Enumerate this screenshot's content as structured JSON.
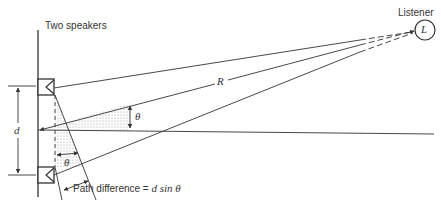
{
  "diagram": {
    "labels": {
      "two_speakers": "Two speakers",
      "listener": "Listener",
      "listener_symbol": "L",
      "distance": "R",
      "separation": "d",
      "angle_right": "θ",
      "angle_bottom": "θ",
      "path_difference": "Path difference = ",
      "path_difference_formula": "d sin θ"
    },
    "colors": {
      "line": "#333333",
      "shading": "#b8b8b8",
      "background": "#ffffff"
    }
  }
}
